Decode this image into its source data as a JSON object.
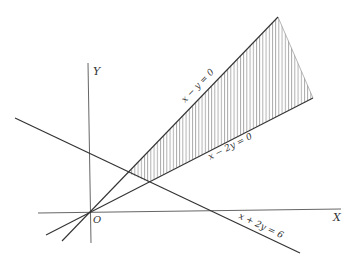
{
  "diagram": {
    "axes": {
      "x_label": "X",
      "y_label": "Y",
      "origin_label": "O"
    },
    "lines": [
      {
        "id": "line1",
        "equation": "x − y = 0"
      },
      {
        "id": "line2",
        "equation": "x − 2y = 0"
      },
      {
        "id": "line3",
        "equation": "x + 2y = 6"
      }
    ],
    "shaded_region": "region between x − y = 0 and x − 2y = 0, above x + 2y = 6",
    "colors": {
      "line": "#333333",
      "axis": "#666666",
      "hatch": "#555555",
      "background": "#ffffff"
    }
  }
}
